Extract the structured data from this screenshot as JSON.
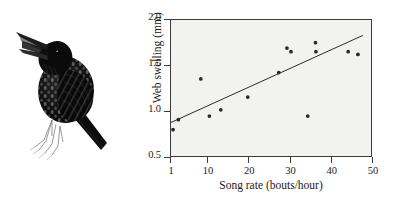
{
  "figure": {
    "illustration": {
      "name": "european-starling-singing",
      "description": "Ink illustration of a singing European starling perched, beak open"
    }
  },
  "chart_data": {
    "type": "scatter",
    "title": "",
    "xlabel": "Song rate (bouts/hour)",
    "ylabel": "Web swelling (mm)",
    "xlim": [
      1,
      50
    ],
    "ylim": [
      0.5,
      2.0
    ],
    "xticks": [
      1,
      10,
      20,
      30,
      40,
      50
    ],
    "xtick_labels": [
      "1",
      "10",
      "20",
      "30",
      "40",
      "50"
    ],
    "yticks": [
      0.5,
      1.0,
      1.5,
      2.0
    ],
    "ytick_labels": [
      "0.5",
      "1.0",
      "1.5",
      "2.0"
    ],
    "grid": false,
    "legend": "none",
    "point_color": "#2b2b2b",
    "line_color": "#2b2b2b",
    "plot_background": "#f2f2f0",
    "frame_color": "#3c3c3c",
    "points": [
      {
        "x": 1.5,
        "y": 0.79
      },
      {
        "x": 2.8,
        "y": 0.9
      },
      {
        "x": 8.3,
        "y": 1.35
      },
      {
        "x": 10.4,
        "y": 0.94
      },
      {
        "x": 13.2,
        "y": 1.01
      },
      {
        "x": 19.8,
        "y": 1.15
      },
      {
        "x": 27.4,
        "y": 1.42
      },
      {
        "x": 29.4,
        "y": 1.69
      },
      {
        "x": 30.4,
        "y": 1.65
      },
      {
        "x": 34.5,
        "y": 0.94
      },
      {
        "x": 36.4,
        "y": 1.75
      },
      {
        "x": 36.5,
        "y": 1.65
      },
      {
        "x": 44.4,
        "y": 1.65
      },
      {
        "x": 46.8,
        "y": 1.62
      }
    ],
    "regression_line": {
      "x_start": 1.0,
      "y_start": 0.87,
      "x_end": 48.0,
      "y_end": 1.83
    }
  }
}
